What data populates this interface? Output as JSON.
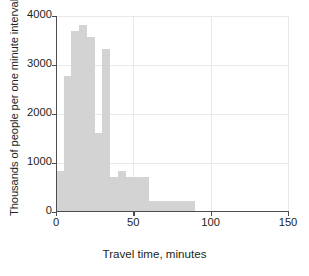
{
  "chart_data": {
    "type": "bar",
    "title": "",
    "subtitle": "",
    "xlabel": "Travel time, minutes",
    "ylabel": "Thousands of people per one minute interval",
    "xlim": [
      0,
      150
    ],
    "ylim": [
      0,
      4000
    ],
    "xticks": [
      0,
      50,
      100,
      150
    ],
    "xtick_labels": [
      "0",
      "50",
      "100",
      "150"
    ],
    "yticks": [
      0,
      1000,
      2000,
      3000,
      4000
    ],
    "ytick_labels": [
      "0",
      "1000",
      "2000",
      "3000",
      "4000"
    ],
    "grid": "horizontal-and-vertical-light",
    "legend": "none",
    "bar_color": "#d3d3d4",
    "axis_color": "#4d4d4f",
    "grid_color": "#e9e9ea",
    "histogram_note": "Density histogram: bar height = thousands of people per one-minute interval",
    "bins": [
      {
        "start": 0,
        "end": 5,
        "value": 830
      },
      {
        "start": 5,
        "end": 10,
        "value": 2780
      },
      {
        "start": 10,
        "end": 15,
        "value": 3700
      },
      {
        "start": 15,
        "end": 20,
        "value": 3820
      },
      {
        "start": 20,
        "end": 25,
        "value": 3580
      },
      {
        "start": 25,
        "end": 30,
        "value": 1620
      },
      {
        "start": 30,
        "end": 35,
        "value": 3320
      },
      {
        "start": 35,
        "end": 40,
        "value": 720
      },
      {
        "start": 40,
        "end": 45,
        "value": 830
      },
      {
        "start": 45,
        "end": 60,
        "value": 720
      },
      {
        "start": 60,
        "end": 90,
        "value": 230
      },
      {
        "start": 90,
        "end": 150,
        "value": 25
      }
    ]
  }
}
